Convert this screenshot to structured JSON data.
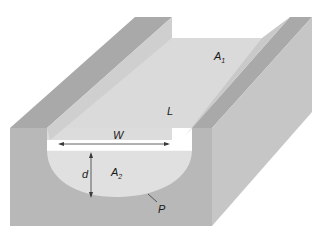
{
  "diagram": {
    "labels": {
      "A1": {
        "base": "A",
        "sub": "1"
      },
      "A2": {
        "base": "A",
        "sub": "2"
      },
      "L": "L",
      "W": "W",
      "d": "d",
      "P": "P"
    },
    "colors": {
      "background": "#ffffff",
      "wall_top": "#a8a8a8",
      "wall_front": "#b9b9b9",
      "wall_side": "#c4c4c4",
      "channel_floor": "#d9d9d9",
      "water_section": "#e2e2e2",
      "line": "#3a3a3a"
    }
  }
}
